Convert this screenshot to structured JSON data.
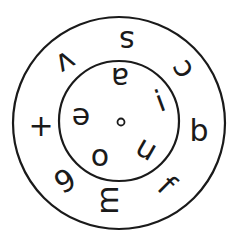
{
  "diagram": {
    "type": "concentric-letter-wheel",
    "stroke_color": "#1a1a1a",
    "background_color": "#ffffff",
    "outer_circle": {
      "cx": 119,
      "cy": 123,
      "r": 106
    },
    "inner_circle": {
      "cx": 119,
      "cy": 121,
      "r": 60
    },
    "center_dot": {
      "cx": 121,
      "cy": 122,
      "r": 3.5
    },
    "outer_ring_letters": [
      {
        "char": "s",
        "x": 127,
        "y": 41,
        "rotate": 180
      },
      {
        "char": "c",
        "x": 181,
        "y": 70,
        "rotate": -120
      },
      {
        "char": "b",
        "x": 199,
        "y": 130,
        "rotate": 0
      },
      {
        "char": "f",
        "x": 167,
        "y": 185,
        "rotate": 45
      },
      {
        "char": "m",
        "x": 107,
        "y": 200,
        "rotate": -90
      },
      {
        "char": "9",
        "x": 65,
        "y": 181,
        "rotate": -30
      },
      {
        "char": "+",
        "x": 41,
        "y": 125,
        "rotate": 0
      },
      {
        "char": "v",
        "x": 66,
        "y": 63,
        "rotate": 150
      }
    ],
    "inner_ring_letters": [
      {
        "char": "a",
        "x": 120,
        "y": 78,
        "rotate": 180
      },
      {
        "char": "i",
        "x": 160,
        "y": 101,
        "rotate": -20
      },
      {
        "char": "u",
        "x": 147,
        "y": 148,
        "rotate": 30
      },
      {
        "char": "o",
        "x": 100,
        "y": 155,
        "rotate": 0
      },
      {
        "char": "e",
        "x": 81,
        "y": 118,
        "rotate": 180
      }
    ]
  }
}
